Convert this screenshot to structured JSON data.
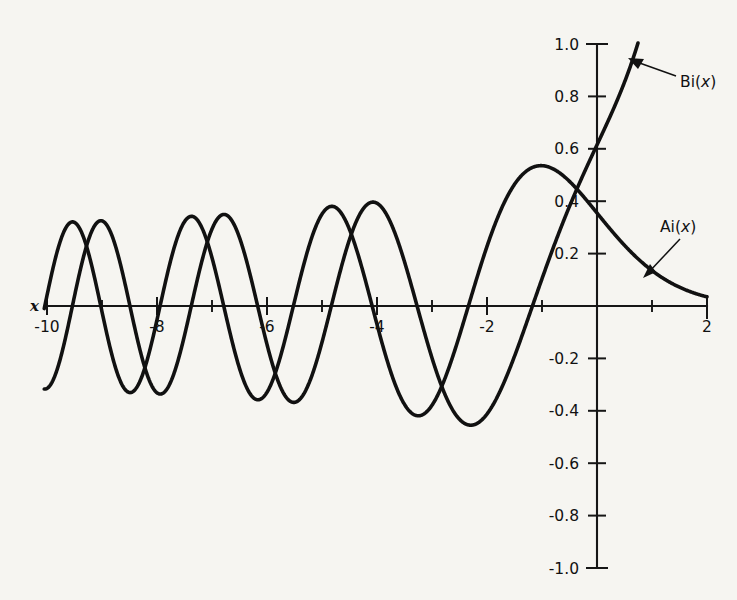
{
  "figure": {
    "background_color": "#f6f5f1",
    "ink_color": "#111111"
  },
  "axes": {
    "x_axis_name": "x",
    "y_axis_name": "",
    "x_tick_labels": [
      "-10",
      "-8",
      "-6",
      "-4",
      "-2",
      "2"
    ],
    "y_tick_labels": [
      "1.0",
      "0.8",
      "0.6",
      "0.4",
      "0.2",
      "-0.2",
      "-0.4",
      "-0.6",
      "-0.8",
      "-1.0"
    ]
  },
  "annotations": {
    "bi_label_prefix": "Bi(",
    "bi_label_var": "x",
    "bi_label_suffix": ")",
    "ai_label_prefix": "Ai(",
    "ai_label_var": "x",
    "ai_label_suffix": ")"
  },
  "chart_data": {
    "type": "line",
    "xlabel": "x",
    "ylabel": "",
    "xlim": [
      -10,
      2
    ],
    "ylim": [
      -1.0,
      1.0
    ],
    "grid": false,
    "legend": "inline-annotations",
    "x_ticks": [
      -10,
      -9,
      -8,
      -7,
      -6,
      -5,
      -4,
      -3,
      -2,
      -1,
      0,
      1,
      2
    ],
    "x_ticks_labeled": [
      -10,
      -8,
      -6,
      -4,
      -2,
      2
    ],
    "y_ticks": [
      -1.0,
      -0.8,
      -0.6,
      -0.4,
      -0.2,
      0.2,
      0.4,
      0.6,
      0.8,
      1.0
    ],
    "y_ticks_labeled": [
      1.0,
      0.8,
      0.6,
      0.4,
      0.2,
      -0.2,
      -0.4,
      -0.6,
      -0.8,
      -1.0
    ],
    "series": [
      {
        "name": "Ai(x)",
        "description": "Airy function of the first kind: oscillatory and decaying for x<0, exponentially decaying for x>0.",
        "x": [
          -10.0,
          -9.75,
          -9.5,
          -9.25,
          -9.0,
          -8.75,
          -8.5,
          -8.25,
          -8.0,
          -7.75,
          -7.5,
          -7.25,
          -7.0,
          -6.75,
          -6.5,
          -6.25,
          -6.0,
          -5.75,
          -5.5,
          -5.25,
          -5.0,
          -4.75,
          -4.5,
          -4.25,
          -4.0,
          -3.75,
          -3.5,
          -3.25,
          -3.0,
          -2.75,
          -2.5,
          -2.25,
          -2.0,
          -1.75,
          -1.5,
          -1.25,
          -1.0,
          -0.75,
          -0.5,
          -0.25,
          0.0,
          0.25,
          0.5,
          0.75,
          1.0,
          1.25,
          1.5,
          1.75,
          2.0
        ],
        "y": [
          0.041,
          0.312,
          0.335,
          0.118,
          -0.181,
          -0.361,
          -0.306,
          -0.049,
          0.245,
          0.38,
          0.301,
          0.034,
          -0.247,
          -0.376,
          -0.282,
          0.009,
          0.329,
          0.437,
          0.279,
          -0.072,
          -0.351,
          -0.382,
          -0.165,
          0.185,
          0.381,
          0.297,
          -0.026,
          -0.326,
          -0.379,
          -0.173,
          0.164,
          0.372,
          0.227,
          -0.072,
          -0.207,
          0.013,
          0.535,
          0.401,
          0.475,
          0.398,
          0.355,
          0.304,
          0.232,
          0.165,
          0.135,
          0.09,
          0.072,
          0.047,
          0.034
        ],
        "notes": "First zero at x = -2.338, second at -4.088, third at -5.521, fourth at -6.787, fifth at -7.944, sixth at -9.023; Ai(0) = 0.3550"
      },
      {
        "name": "Bi(x)",
        "description": "Airy function of the second kind: oscillatory for x<0, rapidly increasing for x>0.",
        "x": [
          -10.0,
          -9.75,
          -9.5,
          -9.25,
          -9.0,
          -8.75,
          -8.5,
          -8.25,
          -8.0,
          -7.75,
          -7.5,
          -7.25,
          -7.0,
          -6.75,
          -6.5,
          -6.25,
          -6.0,
          -5.75,
          -5.5,
          -5.25,
          -5.0,
          -4.75,
          -4.5,
          -4.25,
          -4.0,
          -3.75,
          -3.5,
          -3.25,
          -3.0,
          -2.75,
          -2.5,
          -2.25,
          -2.0,
          -1.75,
          -1.5,
          -1.25,
          -1.0,
          -0.75,
          -0.5,
          -0.25,
          0.0,
          0.25,
          0.5,
          0.75,
          1.0
        ],
        "y": [
          -0.314,
          -0.141,
          0.152,
          0.34,
          0.307,
          0.077,
          -0.2,
          -0.352,
          -0.265,
          0.01,
          0.273,
          0.369,
          0.232,
          -0.067,
          -0.318,
          -0.36,
          -0.146,
          0.205,
          0.387,
          0.292,
          -0.038,
          -0.348,
          -0.388,
          -0.148,
          0.219,
          0.398,
          0.271,
          -0.108,
          -0.198,
          0.279,
          0.492,
          0.364,
          -0.412,
          0.059,
          0.352,
          0.519,
          0.604,
          0.662,
          0.855,
          0.536,
          0.615,
          0.71,
          0.855,
          1.019,
          1.207
        ],
        "notes": "Bi(0) = 0.6149; Bi grows rapidly for positive x and leaves the top of the plot near x = 1.05"
      }
    ]
  }
}
